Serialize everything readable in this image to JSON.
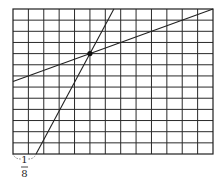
{
  "diagram": {
    "grid": {
      "cols": 13,
      "rows": 13,
      "origin_px": [
        13,
        9
      ],
      "width_px": 200,
      "height_px": 145,
      "line_color": "#2a2a2a"
    },
    "lines": [
      {
        "name": "steep-line",
        "from_grid": [
          1.5,
          0
        ],
        "to_grid": [
          6.556,
          13
        ],
        "passes_through": [
          5,
          9
        ]
      },
      {
        "name": "shallow-line",
        "from_grid": [
          0,
          6.5
        ],
        "to_grid": [
          13,
          13
        ],
        "passes_through": [
          5,
          9
        ]
      }
    ],
    "intersection_point": [
      5,
      9
    ],
    "brace": {
      "from_grid_x": 0,
      "to_grid_x": 1.5,
      "style": "dotted"
    },
    "label": {
      "numerator": "1",
      "denominator": "8"
    }
  }
}
